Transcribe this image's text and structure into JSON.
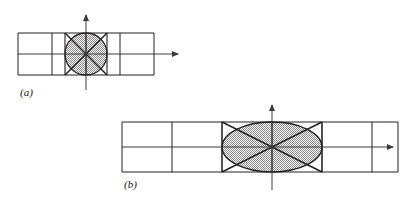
{
  "figure": {
    "background_color": "#ffffff",
    "line_color": "#231f20",
    "axis_color": "#3a3a3a",
    "fill_color": "#bfbfbf",
    "fill_pattern": "stipple-dots"
  },
  "panels": [
    {
      "id": "a",
      "label": "(a)",
      "shape": "circle",
      "grid": {
        "columns": 4,
        "rows": 2,
        "x": 18,
        "y": 33,
        "cell_width": 34,
        "cell_height": 21
      },
      "axes": {
        "origin_x": 86,
        "origin_y": 54,
        "x_axis_start": 18,
        "x_axis_end": 183,
        "y_axis_top": 12,
        "y_axis_bottom": 92,
        "arrow_x": true,
        "arrow_y": true
      },
      "conic": {
        "center_x": 86,
        "center_y": 54,
        "radius_x": 21,
        "radius_y": 21,
        "bbox_columns_spanned": 1,
        "bbox_rows_spanned": 2,
        "diagonals": true
      },
      "label_pos": {
        "x": 20,
        "y": 95
      }
    },
    {
      "id": "b",
      "label": "(b)",
      "shape": "ellipse",
      "grid": {
        "columns": 6,
        "rows": 2,
        "x": 122,
        "y": 122,
        "cell_width": 50,
        "cell_height": 25
      },
      "axes": {
        "origin_x": 272,
        "origin_y": 147,
        "x_axis_start": 122,
        "x_axis_end": 398,
        "y_axis_top": 102,
        "y_axis_bottom": 192,
        "arrow_x": true,
        "arrow_y": true
      },
      "conic": {
        "center_x": 272,
        "center_y": 147,
        "radius_x": 50,
        "radius_y": 25,
        "bbox_columns_spanned": 2,
        "bbox_rows_spanned": 2,
        "diagonals": true
      },
      "label_pos": {
        "x": 124,
        "y": 187
      }
    }
  ]
}
